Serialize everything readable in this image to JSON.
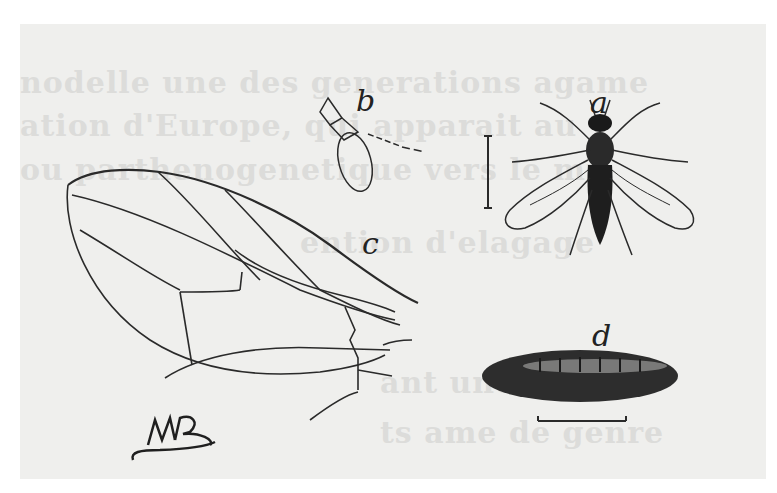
{
  "figure": {
    "labels": {
      "a": "a",
      "b": "b",
      "c": "c",
      "d": "d"
    },
    "signature": "MP",
    "bleed_through_text": [
      "nodelle une des generations agame",
      "ation d'Europe, qui apparait au",
      "ou parthenogenetique vers le mi",
      "ention d'elagage",
      "ant une ligne",
      "ts ame de genre"
    ]
  }
}
